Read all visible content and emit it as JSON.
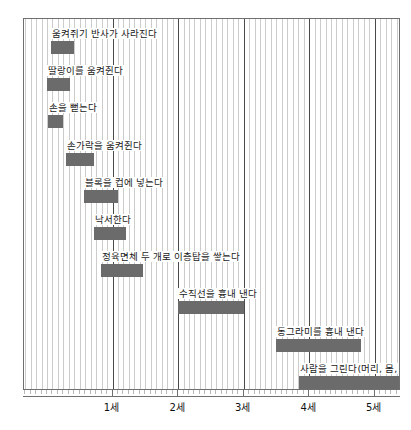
{
  "figure": {
    "top_strip_text": "",
    "axis_unit_label": "세"
  },
  "chart_data": {
    "type": "bar",
    "orientation": "horizontal-gantt",
    "title": "",
    "subtitle": "",
    "xlabel": "",
    "ylabel": "",
    "xlim": [
      -0.35,
      5.4
    ],
    "grid": true,
    "grid_minor_step_years": 0.0833,
    "legend": "none",
    "bar_color": "#6b6b6b",
    "axis_tick_labels": [
      "1세",
      "2세",
      "3세",
      "4세",
      "5세"
    ],
    "axis_tick_values": [
      1,
      2,
      3,
      4,
      5
    ],
    "categories": [
      "움켜쥐기 반사가 사라진다",
      "딸랑이를 움켜쥔다",
      "손을 뻗는다",
      "손가락을 움켜쥔다",
      "블록을 컵에 넣는다",
      "낙서한다",
      "정육면체 두 개로 이층탑을 쌓는다",
      "수직선을 흉내 낸다",
      "동그라미를 흉내 낸다",
      "사람을 그린다(머리, 몸, 팔, 다리)"
    ],
    "bars": [
      {
        "label": "움켜쥐기 반사가 사라진다",
        "start": 0.06,
        "end": 0.41
      },
      {
        "label": "딸랑이를 움켜쥔다",
        "start": 0.0,
        "end": 0.36
      },
      {
        "label": "손을 뻗는다",
        "start": 0.02,
        "end": 0.24
      },
      {
        "label": "손가락을 움켜쥔다",
        "start": 0.29,
        "end": 0.72
      },
      {
        "label": "블록을 컵에 넣는다",
        "start": 0.56,
        "end": 1.09
      },
      {
        "label": "낙서한다",
        "start": 0.71,
        "end": 1.21
      },
      {
        "label": "정육면체 두 개로 이층탑을 쌓는다",
        "start": 0.83,
        "end": 1.47
      },
      {
        "label": "수직선을 흉내 낸다",
        "start": 2.0,
        "end": 3.0
      },
      {
        "label": "동그라미를 흉내 낸다",
        "start": 3.5,
        "end": 4.79
      },
      {
        "label": "사람을 그린다(머리, 몸, 팔, 다리)",
        "start": 3.85,
        "end": 5.53
      }
    ]
  }
}
